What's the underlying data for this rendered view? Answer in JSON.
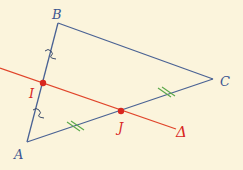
{
  "diagram": {
    "type": "geometry-triangle-midline",
    "colors": {
      "background": "#fbf4dc",
      "triangle": "#4a6294",
      "line": "#e0442a",
      "points": "#d8261e",
      "equal_marks_green": "#5aa84a",
      "equal_marks_tilde": "#3a4a6a",
      "vertex_label": "#3a5590",
      "line_label": "#d8261e"
    },
    "points": {
      "A": {
        "label": "A",
        "x": 27,
        "y": 142
      },
      "B": {
        "label": "B",
        "x": 58,
        "y": 23
      },
      "C": {
        "label": "C",
        "x": 213,
        "y": 79
      },
      "I": {
        "label": "I",
        "x": 43,
        "y": 83
      },
      "J": {
        "label": "J",
        "x": 121,
        "y": 111
      }
    },
    "line": {
      "label": "Δ",
      "from": {
        "x": 0,
        "y": 68
      },
      "to": {
        "x": 176,
        "y": 129
      }
    },
    "marks": {
      "AB_equal": "single tilde",
      "AC_equal": "double tick"
    }
  }
}
